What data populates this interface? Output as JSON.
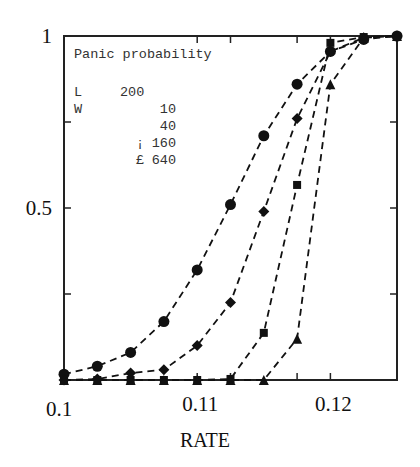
{
  "chart_data": {
    "type": "line",
    "title": "Panic probability",
    "xlabel": "RATE",
    "ylabel": "",
    "xlim": [
      0.1,
      0.125
    ],
    "ylim": [
      0,
      1
    ],
    "x_ticks": [
      0.1,
      0.11,
      0.12
    ],
    "x_tick_labels": [
      "0.1",
      "0.11",
      "0.12"
    ],
    "x_minor_ticks": [
      0.1125,
      0.1175
    ],
    "y_ticks": [
      0.5,
      1
    ],
    "y_tick_labels": [
      "0.5",
      "1"
    ],
    "y_minor_ticks": [
      0.25,
      0.75
    ],
    "grid": false,
    "line_style": "dashed",
    "legend": {
      "position": "top-left inside",
      "lines": [
        {
          "col1": "Panic probability",
          "col2": ""
        },
        {
          "col1": "L",
          "col2": "200"
        },
        {
          "col1": "W",
          "col2": "10"
        },
        {
          "col1": "",
          "col2": "40"
        },
        {
          "col1": "¡",
          "col2": "160"
        },
        {
          "col1": "£",
          "col2": "640"
        }
      ]
    },
    "series": [
      {
        "name": "W=10",
        "marker": "circle",
        "x": [
          0.1,
          0.1025,
          0.105,
          0.1075,
          0.11,
          0.1125,
          0.115,
          0.1175,
          0.12,
          0.1225,
          0.125
        ],
        "y": [
          0.017,
          0.04,
          0.08,
          0.17,
          0.32,
          0.51,
          0.71,
          0.86,
          0.955,
          0.99,
          1.0
        ]
      },
      {
        "name": "W=40",
        "marker": "diamond",
        "x": [
          0.1,
          0.1025,
          0.105,
          0.1075,
          0.11,
          0.1125,
          0.115,
          0.1175,
          0.12,
          0.1225,
          0.125
        ],
        "y": [
          0.0,
          0.003,
          0.02,
          0.03,
          0.1,
          0.225,
          0.49,
          0.76,
          0.955,
          0.995,
          1.0
        ]
      },
      {
        "name": "W=160",
        "marker": "square",
        "x": [
          0.1,
          0.1025,
          0.105,
          0.1075,
          0.11,
          0.1125,
          0.115,
          0.1175,
          0.12,
          0.1225,
          0.125
        ],
        "y": [
          0.0,
          0.0,
          0.0,
          0.0,
          0.0,
          0.003,
          0.137,
          0.567,
          0.98,
          0.997,
          1.0
        ]
      },
      {
        "name": "W=640",
        "marker": "triangle",
        "x": [
          0.1,
          0.1025,
          0.105,
          0.1075,
          0.11,
          0.1125,
          0.115,
          0.1175,
          0.12,
          0.1225,
          0.125
        ],
        "y": [
          0.0,
          0.0,
          0.0,
          0.0,
          0.0,
          0.0,
          0.0,
          0.12,
          0.86,
          0.995,
          1.0
        ]
      }
    ]
  }
}
